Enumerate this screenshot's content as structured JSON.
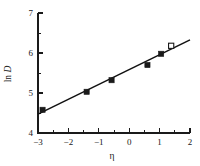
{
  "chart_data": {
    "type": "scatter",
    "title": "",
    "xlabel": "η",
    "ylabel": "ln D",
    "ylabel_parts": {
      "prefix": "ln ",
      "italic": "D"
    },
    "xlim": [
      -3,
      2
    ],
    "ylim": [
      4,
      7
    ],
    "grid": false,
    "legend": "none",
    "x_ticks": [
      -3,
      -2,
      -1,
      0,
      1,
      2
    ],
    "x_tick_labels": [
      "−3",
      "−2",
      "−1",
      "0",
      "1",
      "2"
    ],
    "x_minor_ticks": [
      -2.5,
      -1.5,
      -0.5,
      0.5,
      1.5
    ],
    "y_ticks": [
      4,
      5,
      6,
      7
    ],
    "y_tick_labels": [
      "4",
      "5",
      "6",
      "7"
    ],
    "y_minor_ticks": [
      4.5,
      5.5,
      6.5
    ],
    "points": [
      {
        "x": -2.85,
        "y": 4.58,
        "style": "filled"
      },
      {
        "x": -1.4,
        "y": 5.03,
        "style": "filled"
      },
      {
        "x": -0.58,
        "y": 5.32,
        "style": "filled"
      },
      {
        "x": 0.6,
        "y": 5.7,
        "style": "filled"
      },
      {
        "x": 1.05,
        "y": 5.98,
        "style": "filled"
      },
      {
        "x": 1.38,
        "y": 6.18,
        "style": "open"
      }
    ],
    "series": [
      {
        "name": "ln D vs eta",
        "x": [
          -2.85,
          -1.4,
          -0.58,
          0.6,
          1.05,
          1.38
        ],
        "values": [
          4.58,
          5.03,
          5.32,
          5.7,
          5.98,
          6.18
        ]
      }
    ],
    "fit_line": {
      "type": "linear",
      "x_start": -3.0,
      "y_start": 4.47,
      "x_end": 2.0,
      "y_end": 6.33,
      "slope": 0.372,
      "intercept": 5.586
    },
    "axis_color": "#1a1a1a",
    "marker_color": "#1a1a1a",
    "line_color": "#111111",
    "background_color": "#ffffff"
  }
}
